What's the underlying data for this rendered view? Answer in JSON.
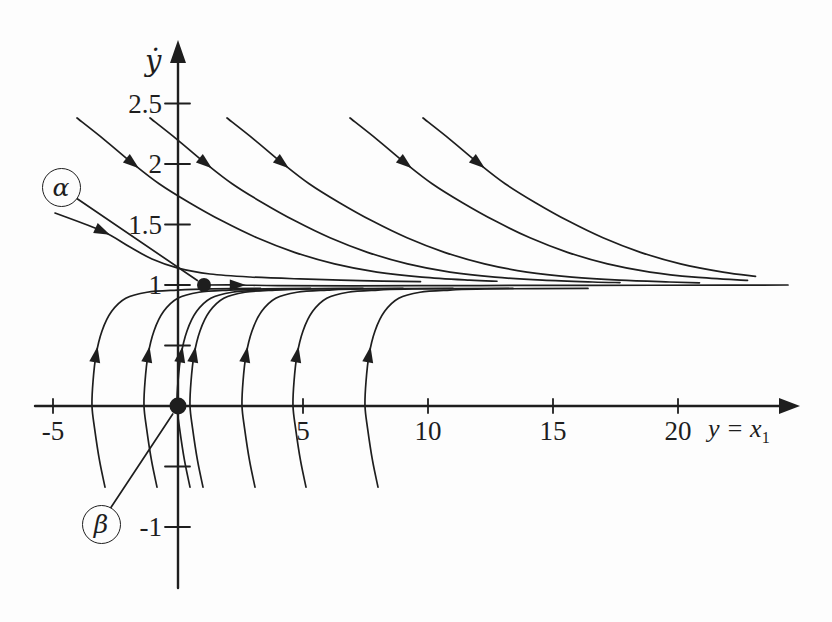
{
  "figure": {
    "background": "#fdfdfd",
    "ink_color": "#1e1e1e"
  },
  "chart_data": {
    "type": "line",
    "subtype": "phase-portrait",
    "title": "",
    "xlabel": "y = x1",
    "xlabel_main": "y = x",
    "xlabel_sub": "1",
    "ylabel": "ẏ",
    "xlim": [
      -5.7,
      24.8
    ],
    "ylim": [
      -1.5,
      3.0
    ],
    "grid": false,
    "legend": "none",
    "x_ticks": [
      -5,
      5,
      10,
      15,
      20
    ],
    "x_tick_labels": [
      "-5",
      "5",
      "10",
      "15",
      "20"
    ],
    "y_ticks": [
      2.5,
      2,
      1.5,
      1,
      -1
    ],
    "y_tick_labels": [
      "2.5",
      "2",
      "1.5",
      "1",
      "-1"
    ],
    "y_minor_ticks": [
      0.5,
      -0.5
    ],
    "equilibrium_point": {
      "x": 0,
      "y": 0
    },
    "initial_point": {
      "x": 1.04,
      "y": 1.0
    },
    "callouts": [
      {
        "label": "α",
        "anchor": {
          "x": -4.72,
          "y": 1.81
        },
        "target": "initial_point"
      },
      {
        "label": "β",
        "anchor": {
          "x": -3.12,
          "y": -0.975
        },
        "target": "equilibrium_point"
      }
    ],
    "series": [
      {
        "name": "alpha-trajectory",
        "arrow_index": 1,
        "points": [
          [
            1.04,
            1.0
          ],
          [
            2.36,
            1.0
          ],
          [
            4.0,
            0.995
          ],
          [
            7.0,
            0.993
          ],
          [
            11.0,
            0.995
          ],
          [
            15.0,
            0.997
          ],
          [
            19.0,
            0.998
          ],
          [
            22.0,
            0.999
          ],
          [
            24.4,
            1.0
          ]
        ]
      },
      {
        "name": "upper-trajectory-0",
        "arrow_index": 1,
        "points": [
          [
            -4.92,
            1.595
          ],
          [
            -3.04,
            1.446
          ],
          [
            -1.92,
            1.314
          ],
          [
            -1.04,
            1.215
          ],
          [
            0.0,
            1.14
          ],
          [
            1.28,
            1.091
          ],
          [
            2.88,
            1.066
          ],
          [
            4.88,
            1.05
          ],
          [
            7.28,
            1.036
          ],
          [
            9.7,
            1.028
          ]
        ]
      },
      {
        "name": "upper-trajectory-1",
        "arrow_index": 2,
        "points": [
          [
            -4.04,
            2.38
          ],
          [
            -2.94,
            2.2
          ],
          [
            -1.84,
            2.01
          ],
          [
            -0.74,
            1.835
          ],
          [
            0.46,
            1.68
          ],
          [
            1.76,
            1.53
          ],
          [
            3.16,
            1.39
          ],
          [
            4.66,
            1.27
          ],
          [
            6.26,
            1.175
          ],
          [
            7.96,
            1.107
          ],
          [
            9.76,
            1.065
          ],
          [
            11.66,
            1.04
          ],
          [
            12.76,
            1.031
          ]
        ]
      },
      {
        "name": "upper-trajectory-2",
        "arrow_index": 2,
        "points": [
          [
            -1.12,
            2.38
          ],
          [
            -0.02,
            2.2
          ],
          [
            1.08,
            2.01
          ],
          [
            2.18,
            1.835
          ],
          [
            3.38,
            1.68
          ],
          [
            4.68,
            1.53
          ],
          [
            6.08,
            1.39
          ],
          [
            7.58,
            1.27
          ],
          [
            9.18,
            1.175
          ],
          [
            10.88,
            1.107
          ],
          [
            12.68,
            1.065
          ],
          [
            14.58,
            1.04
          ],
          [
            16.58,
            1.025
          ],
          [
            17.68,
            1.02
          ]
        ]
      },
      {
        "name": "upper-trajectory-3",
        "arrow_index": 2,
        "points": [
          [
            1.96,
            2.38
          ],
          [
            3.06,
            2.2
          ],
          [
            4.16,
            2.01
          ],
          [
            5.26,
            1.835
          ],
          [
            6.46,
            1.68
          ],
          [
            7.76,
            1.53
          ],
          [
            9.16,
            1.39
          ],
          [
            10.66,
            1.27
          ],
          [
            12.26,
            1.175
          ],
          [
            13.96,
            1.107
          ],
          [
            15.76,
            1.065
          ],
          [
            17.66,
            1.04
          ],
          [
            19.66,
            1.025
          ],
          [
            20.86,
            1.018
          ]
        ]
      },
      {
        "name": "upper-trajectory-4",
        "arrow_index": 2,
        "points": [
          [
            6.88,
            2.38
          ],
          [
            7.98,
            2.2
          ],
          [
            9.08,
            2.01
          ],
          [
            10.18,
            1.835
          ],
          [
            11.38,
            1.68
          ],
          [
            12.68,
            1.53
          ],
          [
            14.08,
            1.39
          ],
          [
            15.58,
            1.27
          ],
          [
            17.18,
            1.175
          ],
          [
            18.88,
            1.107
          ],
          [
            20.68,
            1.065
          ],
          [
            22.78,
            1.038
          ]
        ]
      },
      {
        "name": "upper-trajectory-5",
        "arrow_index": 2,
        "points": [
          [
            9.8,
            2.38
          ],
          [
            10.9,
            2.2
          ],
          [
            12.0,
            2.01
          ],
          [
            13.1,
            1.835
          ],
          [
            14.3,
            1.68
          ],
          [
            15.6,
            1.53
          ],
          [
            17.0,
            1.39
          ],
          [
            18.5,
            1.27
          ],
          [
            20.1,
            1.175
          ],
          [
            21.8,
            1.107
          ],
          [
            23.1,
            1.072
          ]
        ]
      },
      {
        "name": "lower-trajectory-1",
        "arrow_index": 5,
        "points": [
          [
            -2.92,
            -0.67
          ],
          [
            -3.14,
            -0.45
          ],
          [
            -3.34,
            -0.18
          ],
          [
            -3.44,
            0.0
          ],
          [
            -3.4,
            0.2
          ],
          [
            -3.28,
            0.42
          ],
          [
            -3.04,
            0.62
          ],
          [
            -2.66,
            0.78
          ],
          [
            -2.09,
            0.89
          ],
          [
            -1.24,
            0.94
          ],
          [
            -0.04,
            0.958
          ],
          [
            1.36,
            0.968
          ],
          [
            3.3,
            0.972
          ]
        ]
      },
      {
        "name": "lower-trajectory-2",
        "arrow_index": 5,
        "points": [
          [
            -0.84,
            -0.67
          ],
          [
            -1.06,
            -0.45
          ],
          [
            -1.26,
            -0.18
          ],
          [
            -1.36,
            0.0
          ],
          [
            -1.32,
            0.2
          ],
          [
            -1.2,
            0.42
          ],
          [
            -0.96,
            0.62
          ],
          [
            -0.58,
            0.78
          ],
          [
            -0.01,
            0.89
          ],
          [
            0.84,
            0.94
          ],
          [
            2.04,
            0.958
          ],
          [
            3.44,
            0.968
          ],
          [
            5.3,
            0.972
          ]
        ]
      },
      {
        "name": "lower-trajectory-3",
        "arrow_index": 5,
        "points": [
          [
            0.48,
            -0.67
          ],
          [
            0.26,
            -0.45
          ],
          [
            0.06,
            -0.18
          ],
          [
            -0.04,
            0.0
          ],
          [
            0.0,
            0.2
          ],
          [
            0.12,
            0.42
          ],
          [
            0.36,
            0.62
          ],
          [
            0.74,
            0.78
          ],
          [
            1.31,
            0.89
          ],
          [
            2.16,
            0.94
          ],
          [
            3.36,
            0.958
          ],
          [
            4.76,
            0.968
          ],
          [
            7.4,
            0.972
          ]
        ]
      },
      {
        "name": "lower-trajectory-4",
        "arrow_index": 5,
        "points": [
          [
            1.0,
            -0.67
          ],
          [
            0.78,
            -0.45
          ],
          [
            0.58,
            -0.18
          ],
          [
            0.48,
            0.0
          ],
          [
            0.52,
            0.2
          ],
          [
            0.64,
            0.42
          ],
          [
            0.88,
            0.62
          ],
          [
            1.26,
            0.78
          ],
          [
            1.83,
            0.89
          ],
          [
            2.68,
            0.94
          ],
          [
            3.88,
            0.958
          ],
          [
            5.28,
            0.968
          ],
          [
            7.1,
            0.97
          ],
          [
            9.0,
            0.972
          ]
        ]
      },
      {
        "name": "lower-trajectory-5",
        "arrow_index": 5,
        "points": [
          [
            3.08,
            -0.67
          ],
          [
            2.86,
            -0.45
          ],
          [
            2.66,
            -0.18
          ],
          [
            2.56,
            0.0
          ],
          [
            2.6,
            0.2
          ],
          [
            2.72,
            0.42
          ],
          [
            2.96,
            0.62
          ],
          [
            3.34,
            0.78
          ],
          [
            3.91,
            0.89
          ],
          [
            4.76,
            0.94
          ],
          [
            5.96,
            0.958
          ],
          [
            7.36,
            0.968
          ],
          [
            11.0,
            0.972
          ]
        ]
      },
      {
        "name": "lower-trajectory-6",
        "arrow_index": 5,
        "points": [
          [
            5.12,
            -0.67
          ],
          [
            4.9,
            -0.45
          ],
          [
            4.7,
            -0.18
          ],
          [
            4.6,
            0.0
          ],
          [
            4.64,
            0.2
          ],
          [
            4.76,
            0.42
          ],
          [
            5.0,
            0.62
          ],
          [
            5.38,
            0.78
          ],
          [
            5.95,
            0.89
          ],
          [
            6.8,
            0.94
          ],
          [
            8.0,
            0.958
          ],
          [
            9.4,
            0.968
          ],
          [
            13.4,
            0.972
          ]
        ]
      },
      {
        "name": "lower-trajectory-7",
        "arrow_index": 5,
        "points": [
          [
            8.0,
            -0.67
          ],
          [
            7.78,
            -0.45
          ],
          [
            7.58,
            -0.18
          ],
          [
            7.48,
            0.0
          ],
          [
            7.52,
            0.2
          ],
          [
            7.64,
            0.42
          ],
          [
            7.88,
            0.62
          ],
          [
            8.26,
            0.78
          ],
          [
            8.83,
            0.89
          ],
          [
            9.68,
            0.94
          ],
          [
            10.88,
            0.958
          ],
          [
            12.28,
            0.968
          ],
          [
            16.4,
            0.972
          ]
        ]
      }
    ]
  }
}
